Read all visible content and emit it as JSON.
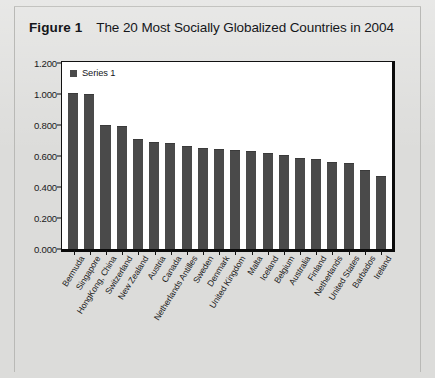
{
  "figure": {
    "label": "Figure 1",
    "title": "The 20 Most Socially Globalized Countries in 2004"
  },
  "legend": {
    "series_label": "Series 1",
    "swatch_color": "#4a4a4a"
  },
  "colors": {
    "bar": "#4a4a4a",
    "plot_background": "#ffffff",
    "page_background": "#dcdcda",
    "axis": "#111111"
  },
  "chart_data": {
    "type": "bar",
    "title": "The 20 Most Socially Globalized Countries in 2004",
    "xlabel": "",
    "ylabel": "",
    "ylim": [
      0,
      1.2
    ],
    "ytick_values": [
      0,
      0.2,
      0.4,
      0.6,
      0.8,
      1.0,
      1.2
    ],
    "ytick_labels": [
      "0.000",
      "0.200",
      "0.400",
      "0.600",
      "0.800",
      "1.000",
      "1.200"
    ],
    "grid": false,
    "legend_position": "top-left-inside",
    "categories": [
      "Bermuda",
      "Singapore",
      "HongKong, China",
      "Switzerland",
      "New Zealand",
      "Austria",
      "Canada",
      "Netherlands Antilles",
      "Sweden",
      "Denmark",
      "United Kingdom",
      "Malta",
      "Iceland",
      "Belgium",
      "Australia",
      "Finland",
      "Netherlands",
      "United States",
      "Barbados",
      "Ireland"
    ],
    "series": [
      {
        "name": "Series 1",
        "values": [
          1.0,
          0.99,
          0.79,
          0.785,
          0.705,
          0.68,
          0.675,
          0.655,
          0.645,
          0.64,
          0.63,
          0.625,
          0.61,
          0.6,
          0.58,
          0.57,
          0.555,
          0.545,
          0.505,
          0.465
        ]
      }
    ]
  }
}
